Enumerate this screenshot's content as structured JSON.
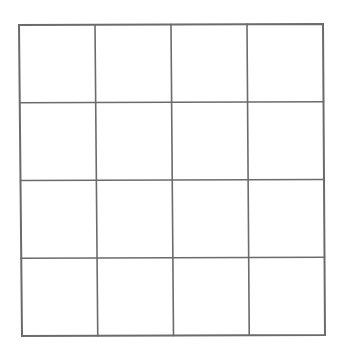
{
  "diagram": {
    "type": "grid",
    "rows": 4,
    "columns": 4,
    "cells_empty": true,
    "line_color": "#6b6b6b",
    "background_color": "#ffffff"
  }
}
